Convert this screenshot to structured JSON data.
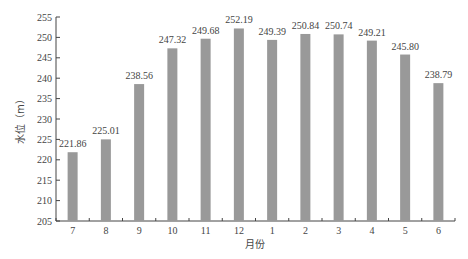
{
  "chart_data": {
    "type": "bar",
    "title": "",
    "xlabel": "月份",
    "ylabel": "水位（m）",
    "categories": [
      "7",
      "8",
      "9",
      "10",
      "11",
      "12",
      "1",
      "2",
      "3",
      "4",
      "5",
      "6"
    ],
    "values": [
      221.86,
      225.01,
      238.56,
      247.32,
      249.68,
      252.19,
      249.39,
      250.84,
      250.74,
      249.21,
      245.8,
      238.79
    ],
    "value_labels": [
      "221.86",
      "225.01",
      "238.56",
      "247.32",
      "249.68",
      "252.19",
      "249.39",
      "250.84",
      "250.74",
      "249.21",
      "245.80",
      "238.79"
    ],
    "ylim": [
      205,
      255
    ],
    "yticks": [
      205,
      210,
      215,
      220,
      225,
      230,
      235,
      240,
      245,
      250,
      255
    ],
    "grid": false,
    "legend": null,
    "bar_color": "#999999"
  },
  "caption": "图 — 水库多年平均逐月水位变化"
}
